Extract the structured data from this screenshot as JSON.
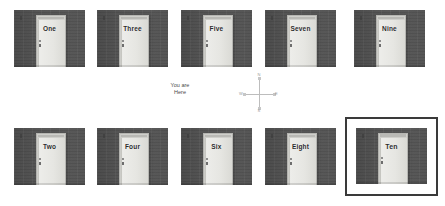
{
  "map": {
    "title": "Door Map",
    "you_are_here": {
      "line1": "You are",
      "line2": "Here"
    },
    "compass": {
      "north": "N",
      "south": "S",
      "east": "E",
      "west": "W"
    },
    "selected_door": "Ten",
    "rows": [
      {
        "row_index": 1,
        "cells": [
          {
            "label": "One",
            "selected": false
          },
          {
            "label": "Three",
            "selected": false
          },
          {
            "label": "Five",
            "selected": false
          },
          {
            "label": "Seven",
            "selected": false
          },
          {
            "label": "Nine",
            "selected": false
          }
        ]
      },
      {
        "row_index": 2,
        "cells": [
          {
            "label": "Two",
            "selected": false
          },
          {
            "label": "Four",
            "selected": false
          },
          {
            "label": "Six",
            "selected": false
          },
          {
            "label": "Eight",
            "selected": false
          },
          {
            "label": "Ten",
            "selected": true
          }
        ]
      }
    ],
    "colors": {
      "wall": "#939393",
      "door_slab": "#e6e6e2",
      "door_frame": "#cfcfcb",
      "selection_border": "#3a3a3a",
      "background": "#ffffff",
      "label_text": "#2b2b2b",
      "compass_line": "#bdbdbd"
    }
  }
}
